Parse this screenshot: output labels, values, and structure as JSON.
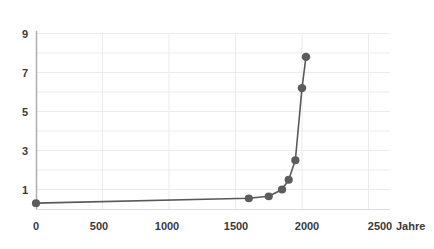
{
  "chart_data": {
    "type": "line",
    "title": "",
    "subtitle": "",
    "xlabel": "Jahre",
    "ylabel": "",
    "x": [
      0,
      1600,
      1750,
      1850,
      1900,
      1950,
      2000,
      2030
    ],
    "values": [
      0.3,
      0.55,
      0.65,
      1.0,
      1.5,
      2.5,
      6.2,
      7.8
    ],
    "series": [
      {
        "name": "",
        "x": [
          0,
          1600,
          1750,
          1850,
          1900,
          1950,
          2000,
          2030
        ],
        "values": [
          0.3,
          0.55,
          0.65,
          1.0,
          1.5,
          2.5,
          6.2,
          7.8
        ]
      }
    ],
    "xlim": [
      0,
      2650
    ],
    "ylim": [
      0,
      9.5
    ],
    "xticks": [
      0,
      500,
      1000,
      1500,
      2000,
      2500
    ],
    "xticklabels": [
      "0",
      "500",
      "1000",
      "1500",
      "2000",
      "2500"
    ],
    "yticks": [
      1,
      3,
      5,
      7,
      9
    ],
    "yticklabels": [
      "1",
      "3",
      "5",
      "7",
      "9"
    ],
    "grid": true,
    "grid_y_minor": [
      1,
      2,
      3,
      4,
      5,
      6,
      7,
      8,
      9
    ],
    "grid_x_minor": [
      500,
      1000,
      1500,
      2000,
      2500
    ],
    "legend": null,
    "legend_position": "none",
    "line_color": "#5a5a5a",
    "marker_color": "#5a5a5a",
    "marker_shape": "circle",
    "axis_color": "#a8a8a8",
    "grid_color": "#e8e8e8"
  },
  "axes": {
    "x_title": "Jahre",
    "y_title": ""
  }
}
